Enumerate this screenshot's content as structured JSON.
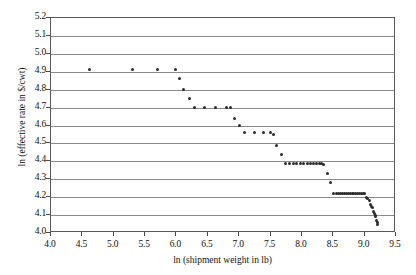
{
  "chart_data": {
    "type": "scatter",
    "title": "",
    "xlabel": "ln (shipment weight in lb)",
    "ylabel": "ln (effective rate in $/cwt)",
    "xlim": [
      4.0,
      9.5
    ],
    "ylim": [
      4.0,
      5.2
    ],
    "xticks": [
      "4.0",
      "4.5",
      "5.0",
      "5.5",
      "6.0",
      "6.5",
      "7.0",
      "7.5",
      "8.0",
      "8.5",
      "9.0",
      "9.5"
    ],
    "xtick_values": [
      4.0,
      4.5,
      5.0,
      5.5,
      6.0,
      6.5,
      7.0,
      7.5,
      8.0,
      8.5,
      9.0,
      9.5
    ],
    "yticks": [
      "4.0",
      "4.1",
      "4.2",
      "4.3",
      "4.4",
      "4.5",
      "4.6",
      "4.7",
      "4.8",
      "4.9",
      "5.0",
      "5.1",
      "5.2"
    ],
    "ytick_values": [
      4.0,
      4.1,
      4.2,
      4.3,
      4.4,
      4.5,
      4.6,
      4.7,
      4.8,
      4.9,
      5.0,
      5.1,
      5.2
    ],
    "grid": "horizontal",
    "legend": "none",
    "marker": "filled-circle",
    "marker_color": "#2b2b2b",
    "gridline_color": "#8a8a8a",
    "frame_color": "#5a5a5a",
    "background_color": "#ffffff",
    "series": [
      {
        "name": "effective rate",
        "points": [
          [
            4.61,
            4.91
          ],
          [
            5.3,
            4.91
          ],
          [
            5.7,
            4.91
          ],
          [
            5.99,
            4.91
          ],
          [
            6.05,
            4.86
          ],
          [
            6.11,
            4.8
          ],
          [
            6.21,
            4.75
          ],
          [
            6.28,
            4.7
          ],
          [
            6.45,
            4.7
          ],
          [
            6.62,
            4.7
          ],
          [
            6.79,
            4.7
          ],
          [
            6.86,
            4.7
          ],
          [
            6.93,
            4.64
          ],
          [
            7.0,
            4.6
          ],
          [
            7.09,
            4.56
          ],
          [
            7.24,
            4.56
          ],
          [
            7.38,
            4.56
          ],
          [
            7.5,
            4.56
          ],
          [
            7.55,
            4.55
          ],
          [
            7.6,
            4.49
          ],
          [
            7.68,
            4.44
          ],
          [
            7.74,
            4.39
          ],
          [
            7.8,
            4.39
          ],
          [
            7.86,
            4.39
          ],
          [
            7.92,
            4.39
          ],
          [
            7.98,
            4.39
          ],
          [
            8.03,
            4.39
          ],
          [
            8.09,
            4.39
          ],
          [
            8.14,
            4.39
          ],
          [
            8.19,
            4.39
          ],
          [
            8.24,
            4.39
          ],
          [
            8.28,
            4.39
          ],
          [
            8.32,
            4.39
          ],
          [
            8.35,
            4.38
          ],
          [
            8.41,
            4.33
          ],
          [
            8.46,
            4.28
          ],
          [
            8.51,
            4.22
          ],
          [
            8.55,
            4.22
          ],
          [
            8.59,
            4.22
          ],
          [
            8.62,
            4.22
          ],
          [
            8.65,
            4.22
          ],
          [
            8.68,
            4.22
          ],
          [
            8.71,
            4.22
          ],
          [
            8.74,
            4.22
          ],
          [
            8.77,
            4.22
          ],
          [
            8.8,
            4.22
          ],
          [
            8.83,
            4.22
          ],
          [
            8.86,
            4.22
          ],
          [
            8.89,
            4.22
          ],
          [
            8.92,
            4.22
          ],
          [
            8.95,
            4.22
          ],
          [
            8.98,
            4.22
          ],
          [
            9.0,
            4.22
          ],
          [
            9.03,
            4.2
          ],
          [
            9.05,
            4.19
          ],
          [
            9.07,
            4.18
          ],
          [
            9.09,
            4.16
          ],
          [
            9.11,
            4.15
          ],
          [
            9.12,
            4.14
          ],
          [
            9.14,
            4.12
          ],
          [
            9.15,
            4.11
          ],
          [
            9.17,
            4.1
          ],
          [
            9.18,
            4.09
          ],
          [
            9.19,
            4.07
          ],
          [
            9.2,
            4.06
          ],
          [
            9.21,
            4.05
          ]
        ]
      }
    ]
  }
}
